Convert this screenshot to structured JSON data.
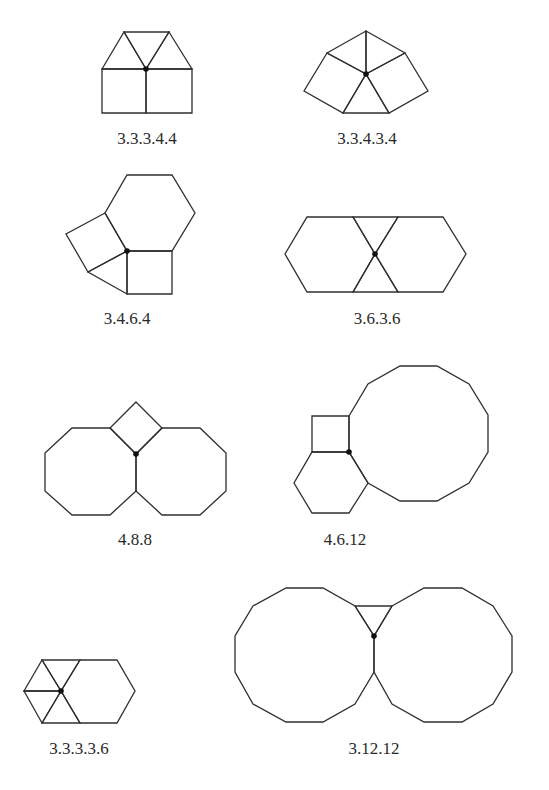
{
  "diagram": {
    "type": "vertex-configurations",
    "colors": {
      "stroke": "#2f2f2f",
      "vertex": "#111111",
      "text": "#2a2a2a",
      "background": "#ffffff"
    },
    "figures": [
      {
        "id": "fig-33344",
        "label": "3.3.3.4.4",
        "label_pos": [
          147,
          144
        ],
        "vertex": [
          146,
          69
        ],
        "polygons": [
          [
            [
              102,
              69
            ],
            [
              124,
              32
            ],
            [
              146,
              69
            ]
          ],
          [
            [
              124,
              32
            ],
            [
              169,
              32
            ],
            [
              146,
              69
            ]
          ],
          [
            [
              169,
              32
            ],
            [
              192,
              69
            ],
            [
              146,
              69
            ]
          ],
          [
            [
              102,
              69
            ],
            [
              146,
              69
            ],
            [
              146,
              113
            ],
            [
              102,
              113
            ]
          ],
          [
            [
              146,
              69
            ],
            [
              192,
              69
            ],
            [
              192,
              113
            ],
            [
              146,
              113
            ]
          ]
        ]
      },
      {
        "id": "fig-33434",
        "label": "3.3.4.3.4",
        "label_pos": [
          367,
          144
        ],
        "vertex": [
          366,
          74
        ],
        "polygons": [
          [
            [
              327,
              53
            ],
            [
              366,
              31
            ],
            [
              366,
              74
            ]
          ],
          [
            [
              366,
              31
            ],
            [
              405,
              53
            ],
            [
              366,
              74
            ]
          ],
          [
            [
              327,
              53
            ],
            [
              366,
              74
            ],
            [
              343,
              113
            ],
            [
              304,
              91
            ]
          ],
          [
            [
              405,
              53
            ],
            [
              428,
              91
            ],
            [
              389,
              113
            ],
            [
              366,
              74
            ]
          ],
          [
            [
              343,
              113
            ],
            [
              366,
              74
            ],
            [
              389,
              113
            ]
          ]
        ]
      },
      {
        "id": "fig-3464",
        "label": "3.4.6.4",
        "label_pos": [
          127,
          324
        ],
        "vertex": [
          127,
          251
        ],
        "polygons": [
          [
            [
              127,
              175
            ],
            [
              172,
              175
            ],
            [
              195,
              213
            ],
            [
              172,
              251
            ],
            [
              127,
              251
            ],
            [
              105,
              213
            ]
          ],
          [
            [
              127,
              251
            ],
            [
              172,
              251
            ],
            [
              172,
              294
            ],
            [
              127,
              294
            ]
          ],
          [
            [
              105,
              213
            ],
            [
              127,
              251
            ],
            [
              88,
              272
            ],
            [
              66,
              234
            ]
          ],
          [
            [
              127,
              251
            ],
            [
              127,
              294
            ],
            [
              88,
              272
            ]
          ]
        ]
      },
      {
        "id": "fig-3636",
        "label": "3.6.3.6",
        "label_pos": [
          377,
          324
        ],
        "vertex": [
          375,
          254
        ],
        "polygons": [
          [
            [
              307,
              217
            ],
            [
              353,
              217
            ],
            [
              375,
              254
            ],
            [
              353,
              292
            ],
            [
              307,
              292
            ],
            [
              285,
              254
            ]
          ],
          [
            [
              398,
              217
            ],
            [
              443,
              217
            ],
            [
              466,
              254
            ],
            [
              443,
              292
            ],
            [
              398,
              292
            ],
            [
              375,
              254
            ]
          ],
          [
            [
              353,
              217
            ],
            [
              398,
              217
            ],
            [
              375,
              254
            ]
          ],
          [
            [
              353,
              292
            ],
            [
              375,
              254
            ],
            [
              398,
              292
            ]
          ]
        ]
      },
      {
        "id": "fig-488",
        "label": "4.8.8",
        "label_pos": [
          135,
          545
        ],
        "vertex": [
          136,
          454
        ],
        "polygons": [
          [
            [
              136,
              402
            ],
            [
              162,
              428
            ],
            [
              136,
              454
            ],
            [
              110,
              428
            ]
          ],
          [
            [
              72,
              428
            ],
            [
              110,
              428
            ],
            [
              136,
              454
            ],
            [
              136,
              491
            ],
            [
              110,
              515
            ],
            [
              72,
              515
            ],
            [
              45,
              491
            ],
            [
              45,
              453
            ]
          ],
          [
            [
              162,
              428
            ],
            [
              200,
              428
            ],
            [
              226,
              453
            ],
            [
              226,
              491
            ],
            [
              200,
              515
            ],
            [
              162,
              515
            ],
            [
              136,
              491
            ],
            [
              136,
              454
            ]
          ]
        ]
      },
      {
        "id": "fig-4612",
        "label": "4.6.12",
        "label_pos": [
          345,
          545
        ],
        "vertex": [
          349,
          452
        ],
        "polygons": [
          [
            [
              312,
              416
            ],
            [
              349,
              416
            ],
            [
              349,
              452
            ],
            [
              312,
              452
            ]
          ],
          [
            [
              312,
              452
            ],
            [
              349,
              452
            ],
            [
              368,
              483
            ],
            [
              349,
              513
            ],
            [
              312,
              513
            ],
            [
              294,
              483
            ]
          ],
          [
            [
              349,
              416
            ],
            [
              368,
              384
            ],
            [
              400,
              366
            ],
            [
              437,
              366
            ],
            [
              469,
              384
            ],
            [
              488,
              415
            ],
            [
              488,
              452
            ],
            [
              469,
              483
            ],
            [
              437,
              501
            ],
            [
              400,
              501
            ],
            [
              368,
              483
            ],
            [
              349,
              452
            ]
          ]
        ]
      },
      {
        "id": "fig-33336",
        "label": "3.3.3.3.6",
        "label_pos": [
          79,
          754
        ],
        "vertex": [
          61,
          691
        ],
        "polygons": [
          [
            [
              42,
              660
            ],
            [
              80,
              660
            ],
            [
              61,
              691
            ]
          ],
          [
            [
              24,
              691
            ],
            [
              42,
              660
            ],
            [
              61,
              691
            ]
          ],
          [
            [
              24,
              691
            ],
            [
              61,
              691
            ],
            [
              42,
              723
            ]
          ],
          [
            [
              42,
              723
            ],
            [
              61,
              691
            ],
            [
              80,
              723
            ]
          ],
          [
            [
              80,
              660
            ],
            [
              117,
              660
            ],
            [
              135,
              691
            ],
            [
              117,
              723
            ],
            [
              80,
              723
            ],
            [
              61,
              691
            ]
          ]
        ]
      },
      {
        "id": "fig-31212",
        "label": "3.12.12",
        "label_pos": [
          374,
          754
        ],
        "vertex": [
          374,
          636
        ],
        "polygons": [
          [
            [
              355,
              606
            ],
            [
              392,
              606
            ],
            [
              374,
              636
            ]
          ],
          [
            [
              286,
              588
            ],
            [
              323,
              588
            ],
            [
              355,
              606
            ],
            [
              374,
              636
            ],
            [
              374,
              672
            ],
            [
              355,
              704
            ],
            [
              323,
              722
            ],
            [
              286,
              722
            ],
            [
              253,
              704
            ],
            [
              235,
              672
            ],
            [
              235,
              636
            ],
            [
              253,
              606
            ]
          ],
          [
            [
              392,
              606
            ],
            [
              424,
              588
            ],
            [
              462,
              588
            ],
            [
              493,
              606
            ],
            [
              512,
              636
            ],
            [
              512,
              672
            ],
            [
              493,
              704
            ],
            [
              462,
              722
            ],
            [
              424,
              722
            ],
            [
              392,
              704
            ],
            [
              374,
              672
            ],
            [
              374,
              636
            ]
          ]
        ]
      }
    ]
  }
}
